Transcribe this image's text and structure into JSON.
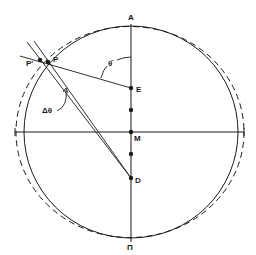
{
  "diagram": {
    "labels": {
      "A": "A",
      "E": "E",
      "M": "M",
      "D": "D",
      "Pi": "Π",
      "P": "P",
      "P_prime": "P'",
      "theta_bar": "θ̄",
      "delta_theta": "Δθ"
    },
    "colors": {
      "ink": "#1a1a1a",
      "background": "#ffffff"
    },
    "circles": [
      {
        "name": "solid-circle",
        "style": "solid",
        "cx": 131,
        "cy": 132,
        "rx": 107,
        "ry": 106
      },
      {
        "name": "dashed-ellipse",
        "style": "dashed",
        "cx": 130,
        "cy": 132,
        "rx": 114,
        "ry": 105.5
      }
    ],
    "points": [
      {
        "name": "E",
        "x": 131,
        "y": 88
      },
      {
        "name": "unlabeled-1",
        "x": 131,
        "y": 110
      },
      {
        "name": "M",
        "x": 131,
        "y": 132
      },
      {
        "name": "unlabeled-2",
        "x": 131,
        "y": 154
      },
      {
        "name": "D",
        "x": 131,
        "y": 178
      },
      {
        "name": "P",
        "x": 48,
        "y": 62
      },
      {
        "name": "P'",
        "x": 40,
        "y": 60
      }
    ]
  }
}
